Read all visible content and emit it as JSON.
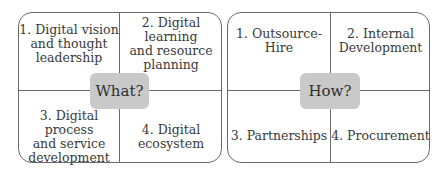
{
  "diagrams": [
    {
      "center_label": "What?",
      "quadrants": [
        {
          "lines": [
            "1. Digital vision",
            "and thought",
            "leadership"
          ]
        },
        {
          "lines": [
            "2. Digital learning",
            "and resource",
            "planning"
          ]
        },
        {
          "lines": [
            "3. Digital process",
            "and service",
            "development"
          ]
        },
        {
          "lines": [
            "4. Digital",
            "ecosystem"
          ]
        }
      ]
    },
    {
      "center_label": "How?",
      "quadrants": [
        {
          "lines": [
            "1. Outsource-",
            "Hire"
          ]
        },
        {
          "lines": [
            "2. Internal",
            "Development"
          ]
        },
        {
          "lines": [
            "3. Partnerships"
          ]
        },
        {
          "lines": [
            "4. Procurement"
          ]
        }
      ]
    }
  ],
  "colors": {
    "border": "#6a6a6a",
    "center_fill": "#c9c9c9",
    "text": "#3a3a3a"
  }
}
